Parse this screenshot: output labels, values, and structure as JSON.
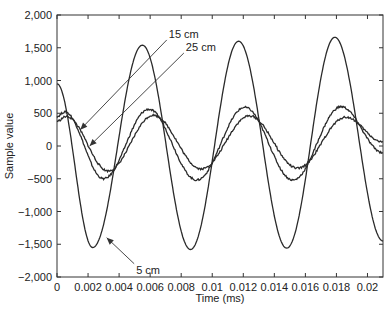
{
  "chart_data": {
    "type": "line",
    "title": "",
    "xlabel": "Time (ms)",
    "ylabel": "Sample value",
    "xlim": [
      0,
      0.021
    ],
    "ylim": [
      -2000,
      2000
    ],
    "grid": false,
    "legend": "none (inline arrow annotations)",
    "x_ticks": [
      0,
      0.002,
      0.004,
      0.006,
      0.008,
      0.01,
      0.012,
      0.014,
      0.016,
      0.018,
      0.02
    ],
    "x_tick_labels": [
      "0",
      "0.002",
      "0.004",
      "0.006",
      "0.008",
      "0.01",
      "0.012",
      "0.014",
      "0.016",
      "0.018",
      "0.02"
    ],
    "y_ticks": [
      -2000,
      -1500,
      -1000,
      -500,
      0,
      500,
      1000,
      1500,
      2000
    ],
    "y_tick_labels": [
      "−2,000",
      "−1,500",
      "−1,000",
      "−500",
      "0",
      "500",
      "1,000",
      "1,500",
      "2,000"
    ],
    "series": [
      {
        "name": "5 cm",
        "color": "#2a2a2a",
        "period": 0.0062,
        "x": [
          0,
          0.0023,
          0.0055,
          0.0086,
          0.0117,
          0.0148,
          0.0179,
          0.021
        ],
        "values": [
          950,
          -1550,
          1540,
          -1580,
          1600,
          -1560,
          1660,
          -1450
        ]
      },
      {
        "name": "15 cm",
        "color": "#2a2a2a",
        "period": 0.0062,
        "x": [
          0,
          0.0005,
          0.003,
          0.0059,
          0.009,
          0.0121,
          0.0152,
          0.0183,
          0.021
        ],
        "values": [
          450,
          520,
          -500,
          560,
          -520,
          590,
          -520,
          600,
          -100
        ]
      },
      {
        "name": "25 cm",
        "color": "#2a2a2a",
        "period": 0.0062,
        "x": [
          0,
          0.0006,
          0.0033,
          0.0062,
          0.0093,
          0.0124,
          0.0155,
          0.0186,
          0.021
        ],
        "values": [
          380,
          450,
          -380,
          470,
          -350,
          460,
          -340,
          440,
          60
        ]
      }
    ],
    "annotations": [
      {
        "text": "15 cm",
        "label_at": [
          0.0072,
          1650
        ],
        "arrow_to": [
          0.0015,
          250
        ]
      },
      {
        "text": "25 cm",
        "label_at": [
          0.0083,
          1450
        ],
        "arrow_to": [
          0.0021,
          0
        ]
      },
      {
        "text": "5 cm",
        "label_at": [
          0.0051,
          -1950
        ],
        "arrow_to": [
          0.0032,
          -1400
        ]
      }
    ]
  }
}
